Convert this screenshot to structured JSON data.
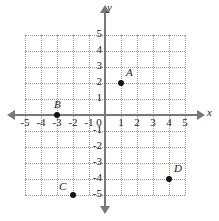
{
  "chart_data": {
    "type": "scatter",
    "title": "",
    "xlabel": "x",
    "ylabel": "y",
    "xlim": [
      -5,
      5
    ],
    "ylim": [
      -5,
      5
    ],
    "grid": true,
    "legend": "none",
    "x_ticks": [
      "-5",
      "-4",
      "-3",
      "-2",
      "-1",
      "1",
      "2",
      "3",
      "4",
      "5"
    ],
    "y_ticks": [
      "5",
      "4",
      "3",
      "2",
      "1",
      "-1",
      "-2",
      "-3",
      "-4",
      "-5"
    ],
    "origin_label": "0",
    "points": [
      {
        "label": "A",
        "x": 1,
        "y": 2
      },
      {
        "label": "B",
        "x": -3,
        "y": 0
      },
      {
        "label": "C",
        "x": -2,
        "y": -5
      },
      {
        "label": "D",
        "x": 4,
        "y": -4
      }
    ]
  },
  "axes": {
    "x_name": "x",
    "y_name": "y"
  },
  "colors": {
    "axis": "#77787a",
    "grid": "#9a9a9a",
    "point": "#141414",
    "text": "#1b1b1b"
  }
}
